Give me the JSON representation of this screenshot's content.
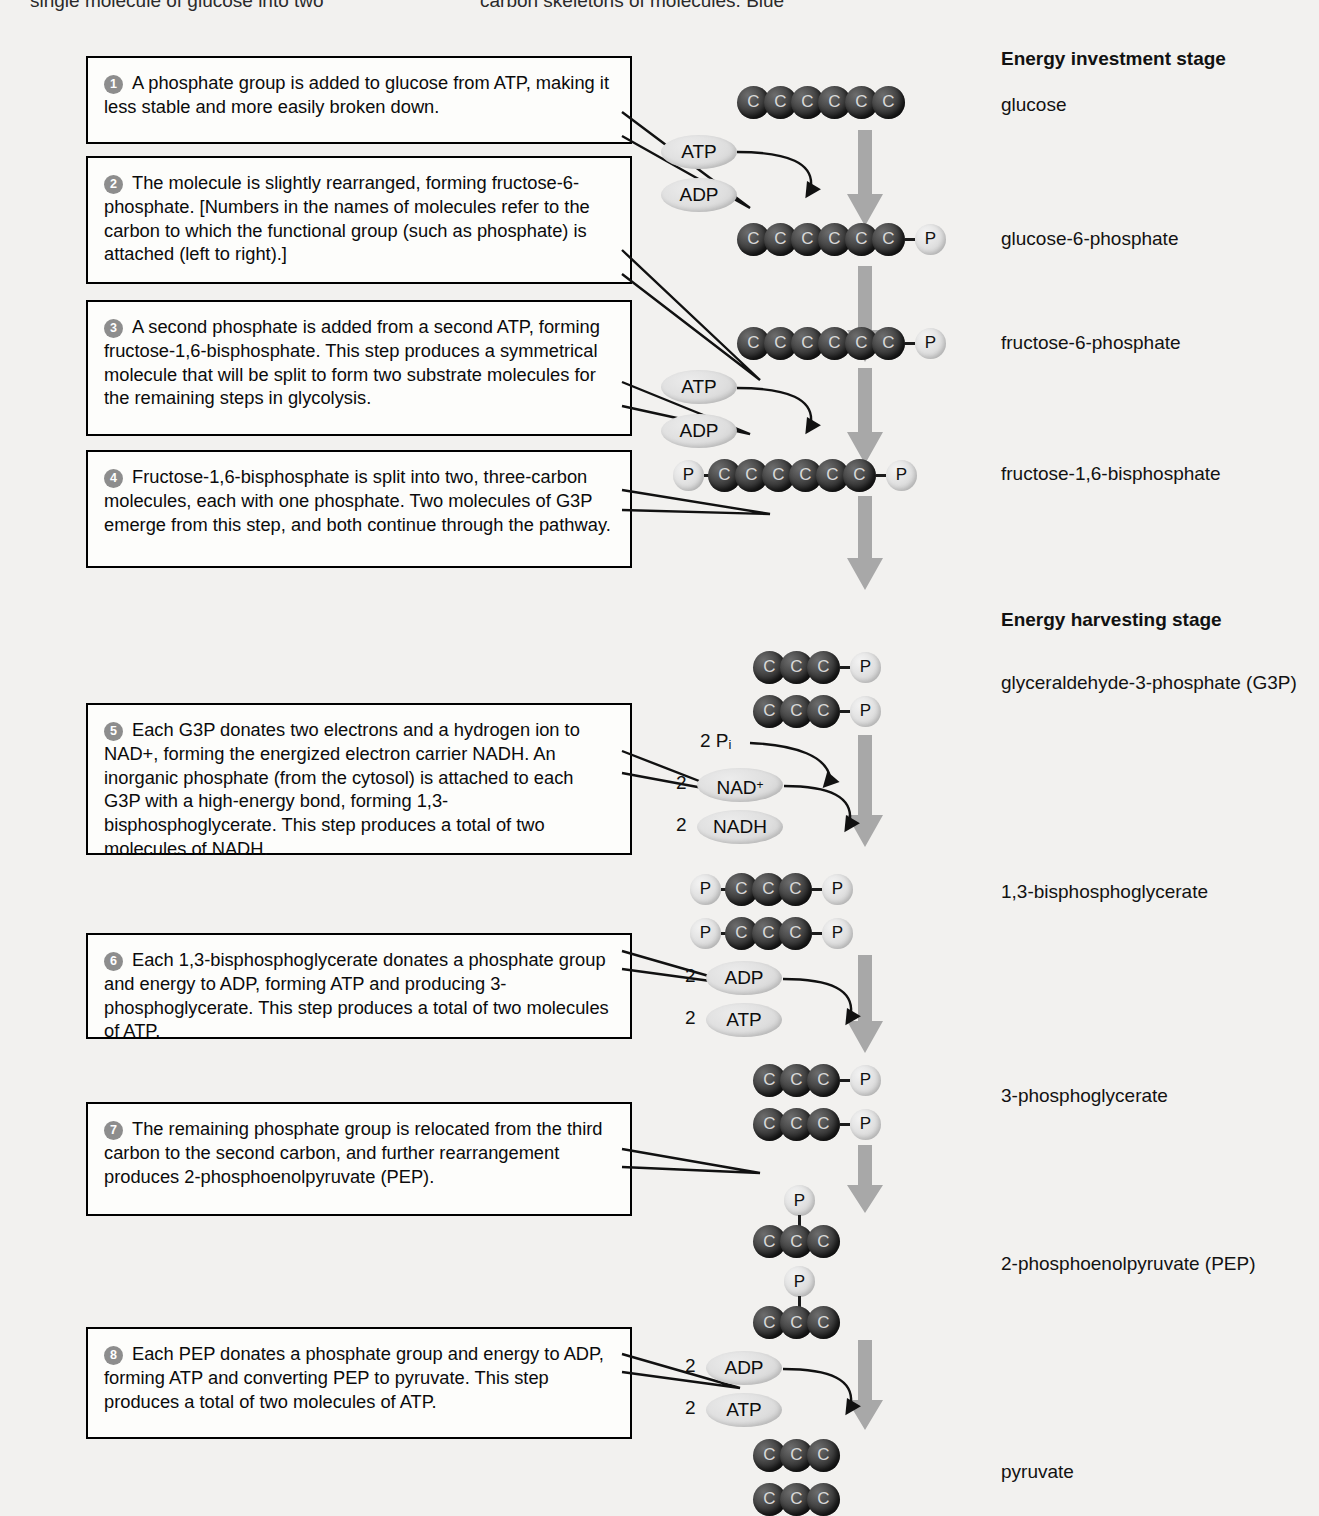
{
  "header_cut_text": {
    "left": "single molecule of glucose into two",
    "right": "carbon skeletons of molecules. Blue"
  },
  "stages": [
    {
      "id": "investment",
      "title": "Energy investment stage"
    },
    {
      "id": "harvesting",
      "title": "Energy harvesting stage"
    }
  ],
  "steps": [
    {
      "number": "1",
      "text": "A phosphate group is added to glucose from ATP, making it less stable and more easily broken down."
    },
    {
      "number": "2",
      "text": "The molecule is slightly rearranged, forming fructose-6-phosphate. [Numbers in the names of molecules refer to the carbon to which the functional group (such as phosphate) is attached (left to right).]"
    },
    {
      "number": "3",
      "text": "A second phosphate is added from a second ATP, forming fructose-1,6-bisphosphate. This step produces a symmetrical molecule that will be split to form two substrate molecules for the remaining steps in glycolysis."
    },
    {
      "number": "4",
      "text": "Fructose-1,6-bisphosphate is split into two, three-carbon molecules, each with one phosphate. Two molecules of G3P emerge from this step, and both continue through the pathway."
    },
    {
      "number": "5",
      "text": "Each G3P donates two electrons and a hydrogen ion to NAD+, forming the energized electron carrier NADH. An inorganic phosphate (from the cytosol) is attached to each G3P with a high-energy bond, forming 1,3-bisphosphoglycerate. This step produces a total of two molecules of NADH."
    },
    {
      "number": "6",
      "text": "Each 1,3-bisphosphoglycerate donates a phosphate group and energy to ADP, forming ATP and producing 3-phosphoglycerate. This step produces a total of two molecules of ATP."
    },
    {
      "number": "7",
      "text": "The remaining phosphate group is relocated from the third carbon to the second carbon, and further rearrangement produces 2-phosphoenolpyruvate (PEP)."
    },
    {
      "number": "8",
      "text": "Each PEP donates a phosphate group and energy to ADP, forming ATP and converting PEP to pyruvate. This step produces a total of two molecules of ATP."
    }
  ],
  "molecules": [
    {
      "id": "glucose",
      "label": "glucose",
      "carbons": 6,
      "phosphate_left": false,
      "phosphate_right": false,
      "copies": 1
    },
    {
      "id": "glucose-6-phosphate",
      "label": "glucose-6-phosphate",
      "carbons": 6,
      "phosphate_left": false,
      "phosphate_right": true,
      "copies": 1
    },
    {
      "id": "fructose-6-phosphate",
      "label": "fructose-6-phosphate",
      "carbons": 6,
      "phosphate_left": false,
      "phosphate_right": true,
      "copies": 1
    },
    {
      "id": "fructose-1-6-bisphosphate",
      "label": "fructose-1,6-bisphosphate",
      "carbons": 6,
      "phosphate_left": true,
      "phosphate_right": true,
      "copies": 1
    },
    {
      "id": "g3p",
      "label": "glyceraldehyde-3-phosphate (G3P)",
      "carbons": 3,
      "phosphate_left": false,
      "phosphate_right": true,
      "copies": 2
    },
    {
      "id": "1-3-bisphosphoglycerate",
      "label": "1,3-bisphosphoglycerate",
      "carbons": 3,
      "phosphate_left": true,
      "phosphate_right": true,
      "copies": 2
    },
    {
      "id": "3-phosphoglycerate",
      "label": "3-phosphoglycerate",
      "carbons": 3,
      "phosphate_left": false,
      "phosphate_right": true,
      "copies": 2
    },
    {
      "id": "pep",
      "label": "2-phosphoenolpyruvate (PEP)",
      "carbons": 3,
      "phosphate_top": true,
      "copies": 2
    },
    {
      "id": "pyruvate",
      "label": "pyruvate",
      "carbons": 3,
      "phosphate_left": false,
      "phosphate_right": false,
      "copies": 2
    }
  ],
  "cofactors": {
    "atp": "ATP",
    "adp": "ADP",
    "nad_plus": "NAD",
    "nad_plus_sup": "+",
    "nadh": "NADH",
    "pi_coef": "2",
    "pi_label": "P",
    "pi_sub": "i",
    "two": "2"
  },
  "carbon_symbol": "C",
  "phosphate_symbol": "P",
  "colors": {
    "background": "#f2f1ef",
    "carbon": "#2b2b2b",
    "phosphate": "#dcdcdc",
    "arrow": "#a8a8a8",
    "box_border": "#000000",
    "badge": "#8d8d8d"
  }
}
